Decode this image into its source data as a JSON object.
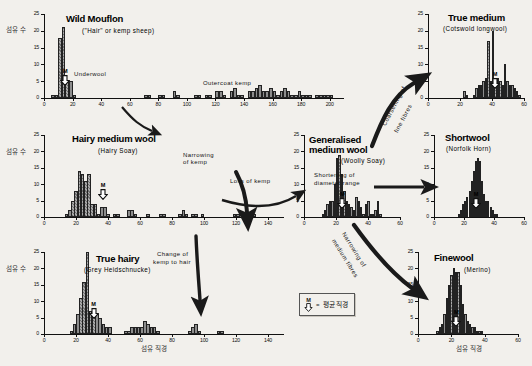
{
  "figure": {
    "axis_titles": {
      "y": "섬유 수",
      "x": "섬유 직경"
    },
    "legend": {
      "marker": "M",
      "equals": "=",
      "text": "평균 직경"
    },
    "colors": {
      "bar_fill": "#8d8d8d",
      "bar_stroke": "#222222",
      "background": "#f2f0ec",
      "arrow": "#1a1a1a"
    }
  },
  "annotations": [
    {
      "id": "underwool",
      "text": "Underwool"
    },
    {
      "id": "outercoat-kemp",
      "text": "Outercoat kemp"
    },
    {
      "id": "coarsening",
      "line1": "Coarsening of",
      "line2": "fine fibres"
    },
    {
      "id": "narrowing-kemp",
      "line1": "Narrowing",
      "line2": "of kemp"
    },
    {
      "id": "loss-of-kemp",
      "text": "Loss of kemp"
    },
    {
      "id": "shortening",
      "line1": "Shortening of",
      "line2": "diameter range"
    },
    {
      "id": "narrowing-medium",
      "line1": "Narrowing of",
      "line2": "medium fibres"
    },
    {
      "id": "change-kemp-hair",
      "line1": "Change of",
      "line2": "kemp to hair"
    }
  ],
  "chart_data": [
    {
      "id": "wild-mouflon",
      "type": "bar",
      "title": "Wild Mouflon",
      "subtitle": "(\"Hair\" or kemp sheep)",
      "xlabel": "",
      "ylabel": "섬유 수",
      "xlim": [
        0,
        210
      ],
      "ylim": [
        0,
        25
      ],
      "xticks": [
        0,
        20,
        40,
        60,
        80,
        100,
        120,
        140,
        160,
        180,
        200
      ],
      "yticks": [
        0,
        5,
        10,
        15,
        20,
        25
      ],
      "grid": false,
      "mean_marker": {
        "label": "M",
        "x": 15
      },
      "bin_width": 2.5,
      "x": [
        5,
        7.5,
        10,
        12.5,
        15,
        17.5,
        20,
        70,
        72.5,
        80,
        82.5,
        90,
        92.5,
        105,
        107.5,
        112.5,
        115,
        120,
        122.5,
        125,
        130,
        132.5,
        135,
        137.5,
        142.5,
        145,
        147.5,
        150,
        152.5,
        155,
        157.5,
        160,
        162.5,
        165,
        167.5,
        170,
        172.5,
        175,
        177.5,
        180,
        182.5,
        185,
        190,
        192.5,
        195,
        197.5,
        200
      ],
      "values": [
        1,
        1,
        18,
        21,
        5,
        5,
        1,
        1,
        1,
        1,
        1,
        2,
        1,
        1,
        1,
        1,
        1,
        2,
        2,
        1,
        2,
        3,
        1,
        1,
        2,
        2,
        3,
        4,
        2,
        2,
        3,
        2,
        1,
        2,
        3,
        2,
        1,
        1,
        2,
        1,
        1,
        1,
        1,
        1,
        1,
        1,
        1
      ],
      "hatched_range": [
        10,
        15
      ]
    },
    {
      "id": "true-medium",
      "type": "bar",
      "title": "True medium",
      "subtitle": "(Cotswold longwool)",
      "xlabel": "",
      "ylabel": "",
      "xlim": [
        0,
        60
      ],
      "ylim": [
        0,
        25
      ],
      "xticks": [
        0,
        20,
        40,
        60
      ],
      "yticks": [
        0,
        5,
        10,
        15,
        20,
        25
      ],
      "grid": false,
      "mean_marker": {
        "label": "M",
        "x": 42
      },
      "bin_width": 1.5,
      "x": [
        22,
        23.5,
        28,
        29.5,
        31,
        32.5,
        34,
        35.5,
        37,
        38.5,
        40,
        41.5,
        43,
        44.5,
        46,
        47.5,
        49,
        50.5,
        52,
        53.5,
        55,
        56.5
      ],
      "values": [
        2,
        1,
        1,
        3,
        4,
        4,
        5,
        6,
        17,
        5,
        20,
        5,
        6,
        5,
        4,
        10,
        5,
        4,
        4,
        3,
        2,
        1
      ],
      "hatched_range": [
        37,
        47.5
      ]
    },
    {
      "id": "hairy-medium-wool",
      "type": "bar",
      "title": "Hairy medium wool",
      "subtitle": "(Hairy Soay)",
      "xlabel": "",
      "ylabel": "섬유 수",
      "xlim": [
        0,
        150
      ],
      "ylim": [
        0,
        25
      ],
      "xticks": [
        0,
        20,
        40,
        60,
        80,
        100,
        120,
        140
      ],
      "yticks": [
        0,
        5,
        10,
        15,
        20,
        25
      ],
      "grid": false,
      "mean_marker": {
        "label": "M",
        "x": 37
      },
      "bin_width": 2.2,
      "x": [
        13,
        15,
        17,
        19,
        21,
        23,
        25,
        27,
        29,
        31,
        33,
        35,
        37,
        39,
        43,
        45,
        52,
        54,
        56,
        64,
        72,
        74,
        84,
        86,
        88,
        92,
        94,
        98,
        118,
        120,
        130
      ],
      "values": [
        1,
        2,
        5,
        8,
        14,
        13,
        11,
        13,
        4,
        4,
        1,
        3,
        3,
        1,
        1,
        1,
        2,
        2,
        1,
        1,
        1,
        1,
        1,
        2,
        1,
        1,
        1,
        1,
        1,
        1,
        1
      ],
      "hatched_range": [
        17,
        31
      ]
    },
    {
      "id": "generalised-medium-wool",
      "type": "bar",
      "title": "Generalised\nmedium wool",
      "title_line1": "Generalised",
      "title_line2": "medium wool",
      "subtitle": "(Woolly Soay)",
      "xlabel": "",
      "ylabel": "",
      "xlim": [
        0,
        60
      ],
      "ylim": [
        0,
        25
      ],
      "xticks": [
        0,
        20,
        40,
        60
      ],
      "yticks": [
        0,
        5,
        10,
        15,
        20,
        25
      ],
      "grid": false,
      "mean_marker": {
        "label": "M",
        "x": 24
      },
      "bin_width": 1.5,
      "x": [
        11,
        12.5,
        14,
        15.5,
        17,
        18.5,
        20,
        21.5,
        23,
        24.5,
        26,
        27.5,
        29,
        30.5,
        32,
        33.5,
        35,
        36.5,
        38,
        39.5,
        41,
        42.5,
        44,
        45.5,
        47
      ],
      "values": [
        1,
        2,
        4,
        5,
        5,
        10,
        18,
        19,
        13,
        8,
        5,
        4,
        3,
        2,
        6,
        5,
        3,
        1,
        4,
        5,
        1,
        1,
        2,
        5,
        1
      ],
      "hatched_range": [
        18.5,
        26
      ]
    },
    {
      "id": "shortwool",
      "type": "bar",
      "title": "Shortwool",
      "subtitle": "(Norfolk Horn)",
      "xlabel": "",
      "ylabel": "",
      "xlim": [
        0,
        60
      ],
      "ylim": [
        0,
        25
      ],
      "xticks": [
        0,
        20,
        40,
        60
      ],
      "yticks": [
        0,
        5,
        10,
        15,
        20,
        25
      ],
      "grid": false,
      "mean_marker": {
        "label": "M",
        "x": 28
      },
      "bin_width": 1.4,
      "x": [
        16,
        17.4,
        18.8,
        20.2,
        21.6,
        23,
        24.4,
        25.8,
        27.2,
        28.6,
        30,
        31.4,
        32.8,
        34.2,
        35.6,
        37,
        38.4,
        39.8,
        41.2
      ],
      "values": [
        1,
        2,
        4,
        5,
        6,
        8,
        11,
        14,
        17,
        18,
        17,
        11,
        7,
        5,
        5,
        3,
        2,
        1,
        1
      ],
      "hatched_range": [
        25.8,
        31.4
      ]
    },
    {
      "id": "true-hairy",
      "type": "bar",
      "title": "True hairy",
      "subtitle": "(Grey Heidschnucke)",
      "xlabel": "섬유 직경",
      "ylabel": "섬유 수",
      "xlim": [
        0,
        150
      ],
      "ylim": [
        0,
        25
      ],
      "xticks": [
        0,
        20,
        40,
        60,
        80,
        100,
        120,
        140
      ],
      "yticks": [
        0,
        5,
        10,
        15,
        20,
        25
      ],
      "grid": false,
      "mean_marker": {
        "label": "M",
        "x": 31
      },
      "bin_width": 2.2,
      "x": [
        16,
        18,
        20,
        22,
        24,
        26,
        28,
        30,
        32,
        34,
        36,
        38,
        40,
        50,
        52,
        54,
        56,
        58,
        60,
        62,
        64,
        66,
        68,
        70,
        90,
        92,
        94,
        96,
        108,
        110
      ],
      "values": [
        1,
        3,
        6,
        11,
        16,
        25,
        7,
        6,
        6,
        5,
        3,
        2,
        2,
        1,
        1,
        2,
        2,
        2,
        2,
        4,
        3,
        2,
        2,
        1,
        1,
        2,
        3,
        1,
        1,
        1
      ],
      "hatched_range": [
        22,
        30
      ]
    },
    {
      "id": "finewool",
      "type": "bar",
      "title": "Finewool",
      "subtitle": "(Merino)",
      "xlabel": "섬유 직경",
      "ylabel": "",
      "xlim": [
        0,
        60
      ],
      "ylim": [
        0,
        25
      ],
      "xticks": [
        0,
        20,
        40,
        60
      ],
      "yticks": [
        0,
        5,
        10,
        15,
        20,
        25
      ],
      "grid": false,
      "mean_marker": {
        "label": "M",
        "x": 23
      },
      "bin_width": 1.4,
      "x": [
        11,
        12.4,
        13.8,
        15.2,
        16.6,
        18,
        19.4,
        20.8,
        22.2,
        23.6,
        25,
        26.4,
        27.8,
        29.2,
        30.6,
        32,
        33.4,
        34.8,
        36.2,
        37.6
      ],
      "values": [
        1,
        2,
        3,
        6,
        11,
        15,
        18,
        20,
        19,
        19,
        15,
        9,
        6,
        4,
        3,
        2,
        2,
        1,
        1,
        1
      ],
      "hatched_range": [
        18,
        25
      ]
    }
  ]
}
